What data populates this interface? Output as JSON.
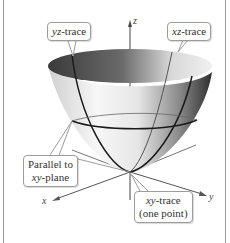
{
  "figure": {
    "surface": "elliptic paraboloid",
    "axes": {
      "x": "x",
      "y": "y",
      "z": "z"
    },
    "callouts": {
      "yz_trace": {
        "italic": "yz",
        "text": "-trace"
      },
      "xz_trace": {
        "italic": "xz",
        "text": "-trace"
      },
      "parallel": {
        "line1": "Parallel to",
        "italic": "xy",
        "text": "-plane"
      },
      "xy_trace": {
        "italic": "xy",
        "text": "-trace",
        "line2": "(one point)"
      }
    },
    "colors": {
      "surface_dark": "#3a3a3a",
      "surface_light": "#f2f2f2",
      "trace": "#1a1a1a",
      "callout_border": "#9c9c9c"
    }
  }
}
